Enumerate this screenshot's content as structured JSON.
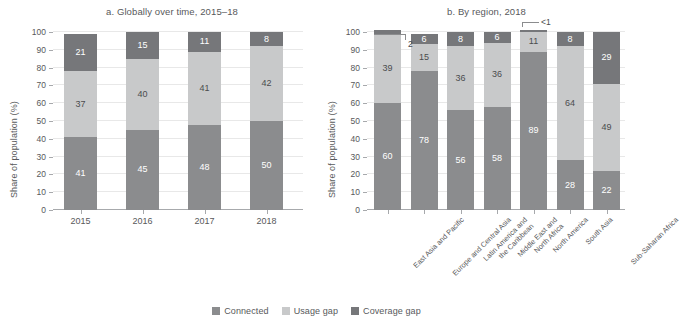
{
  "figure": {
    "ylabel": "Share of population (%)",
    "yticks": [
      0,
      10,
      20,
      30,
      40,
      50,
      60,
      70,
      80,
      90,
      100
    ],
    "ylim": [
      0,
      100
    ]
  },
  "legend": {
    "items": [
      {
        "label": "Connected",
        "color": "#8b8c8e"
      },
      {
        "label": "Usage gap",
        "color": "#c8c9ca"
      },
      {
        "label": "Coverage gap",
        "color": "#76777a"
      }
    ]
  },
  "chart_data": [
    {
      "type": "bar",
      "id": "panel-a",
      "title": "a. Globally over time, 2015–18",
      "stacked": true,
      "xlabel": "",
      "ylabel": "Share of population (%)",
      "ylim": [
        0,
        100
      ],
      "yticks": [
        0,
        10,
        20,
        30,
        40,
        50,
        60,
        70,
        80,
        90,
        100
      ],
      "grid": true,
      "legend_position": "bottom",
      "categories": [
        "2015",
        "2016",
        "2017",
        "2018"
      ],
      "series": [
        {
          "name": "Connected",
          "color": "#8b8c8e",
          "values": [
            41,
            45,
            48,
            50
          ],
          "labels": [
            "41",
            "45",
            "48",
            "50"
          ]
        },
        {
          "name": "Usage gap",
          "color": "#c8c9ca",
          "values": [
            37,
            40,
            41,
            42
          ],
          "labels": [
            "37",
            "40",
            "41",
            "42"
          ]
        },
        {
          "name": "Coverage gap",
          "color": "#76777a",
          "values": [
            21,
            15,
            11,
            8
          ],
          "labels": [
            "21",
            "15",
            "11",
            "8"
          ]
        }
      ]
    },
    {
      "type": "bar",
      "id": "panel-b",
      "title": "b. By region, 2018",
      "stacked": true,
      "xlabel": "",
      "ylabel": "Share of population (%)",
      "ylim": [
        0,
        100
      ],
      "yticks": [
        0,
        10,
        20,
        30,
        40,
        50,
        60,
        70,
        80,
        90,
        100
      ],
      "grid": true,
      "legend_position": "bottom",
      "categories": [
        "East Asia and Pacific",
        "Europe and Central Asia",
        "Latin America and\nthe Caribbean",
        "Middle East and\nNorth Africa",
        "North America",
        "South Asia",
        "Sub-Saharan Africa"
      ],
      "series": [
        {
          "name": "Connected",
          "color": "#8b8c8e",
          "values": [
            60,
            78,
            56,
            58,
            89,
            28,
            22
          ],
          "labels": [
            "60",
            "78",
            "56",
            "58",
            "89",
            "28",
            "22"
          ]
        },
        {
          "name": "Usage gap",
          "color": "#c8c9ca",
          "values": [
            39,
            15,
            36,
            36,
            11,
            64,
            49
          ],
          "labels": [
            "39",
            "15",
            "36",
            "36",
            "11",
            "64",
            "49"
          ]
        },
        {
          "name": "Coverage gap",
          "color": "#76777a",
          "values": [
            2,
            6,
            8,
            6,
            1,
            8,
            29
          ],
          "labels": [
            "2",
            "6",
            "8",
            "6",
            "<1",
            "8",
            "29"
          ]
        }
      ],
      "annotations": [
        {
          "text": "2",
          "for": "East Asia and Pacific",
          "series": "Coverage gap",
          "style": "leader-right"
        },
        {
          "text": "<1",
          "for": "North America",
          "series": "Coverage gap",
          "style": "leader-above"
        }
      ]
    }
  ],
  "panel_a": {
    "title": "a. Globally over time, 2015–18",
    "x_labels": [
      "2015",
      "2016",
      "2017",
      "2018"
    ]
  },
  "panel_b": {
    "title": "b. By region, 2018",
    "x_labels_lines": [
      [
        "East Asia and Pacific"
      ],
      [
        "Europe and Central Asia"
      ],
      [
        "Latin America and",
        "the Caribbean"
      ],
      [
        "Middle East and",
        "North Africa"
      ],
      [
        "North America"
      ],
      [
        "South Asia"
      ],
      [
        "Sub-Saharan Africa"
      ]
    ],
    "callouts": {
      "east_asia": "2",
      "north_america": "<1"
    }
  }
}
